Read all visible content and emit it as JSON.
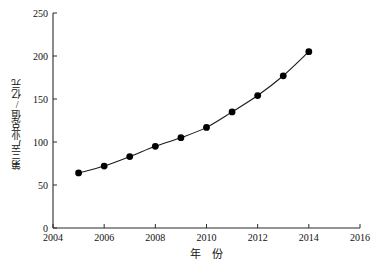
{
  "chart_data": {
    "type": "line",
    "title": "",
    "xlabel": "年　份",
    "ylabel": "第三产业总值/亿元",
    "x": [
      2005,
      2006,
      2007,
      2008,
      2009,
      2010,
      2011,
      2012,
      2013,
      2014
    ],
    "values": [
      64,
      72,
      83,
      95,
      105,
      117,
      135,
      154,
      177,
      205
    ],
    "series": [
      {
        "name": "第三产业总值",
        "values": [
          64,
          72,
          83,
          95,
          105,
          117,
          135,
          154,
          177,
          205
        ]
      }
    ],
    "xlim": [
      2004,
      2016
    ],
    "ylim": [
      0,
      250
    ],
    "xticks": [
      2004,
      2006,
      2008,
      2010,
      2012,
      2014,
      2016
    ],
    "yticks": [
      0,
      50,
      100,
      150,
      200,
      250
    ],
    "xtick_labels": [
      "2004",
      "2006",
      "2008",
      "2010",
      "2012",
      "2014",
      "2016"
    ],
    "ytick_labels": [
      "0",
      "50",
      "100",
      "150",
      "200",
      "250"
    ],
    "grid": false,
    "legend": false,
    "legend_position": "none",
    "marker": "filled-circle",
    "line_color": "#1a1a1a",
    "marker_color": "#000000",
    "background_color": "#ffffff"
  }
}
